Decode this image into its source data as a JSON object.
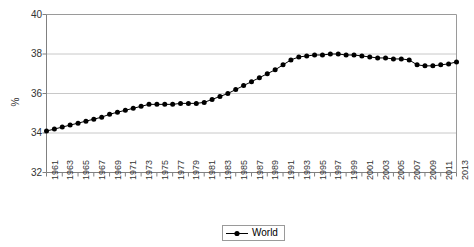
{
  "chart_data": {
    "type": "line",
    "title": "",
    "xlabel": "",
    "ylabel": "%",
    "ylim": [
      32,
      40
    ],
    "yticks": [
      32,
      34,
      36,
      38,
      40
    ],
    "xlim": [
      1961,
      2013
    ],
    "grid": true,
    "legend_position": "bottom",
    "marker": "filled-circle",
    "line_color": "#000000",
    "grid_color": "#c8c8c8",
    "axis_color": "#808080",
    "xticks": [
      1961,
      1963,
      1965,
      1967,
      1969,
      1971,
      1973,
      1975,
      1977,
      1979,
      1981,
      1983,
      1985,
      1987,
      1989,
      1991,
      1993,
      1995,
      1997,
      1999,
      2001,
      2003,
      2005,
      2007,
      2009,
      2011,
      2013
    ],
    "x": [
      1961,
      1962,
      1963,
      1964,
      1965,
      1966,
      1967,
      1968,
      1969,
      1970,
      1971,
      1972,
      1973,
      1974,
      1975,
      1976,
      1977,
      1978,
      1979,
      1980,
      1981,
      1982,
      1983,
      1984,
      1985,
      1986,
      1987,
      1988,
      1989,
      1990,
      1991,
      1992,
      1993,
      1994,
      1995,
      1996,
      1997,
      1998,
      1999,
      2000,
      2001,
      2002,
      2003,
      2004,
      2005,
      2006,
      2007,
      2008,
      2009,
      2010,
      2011,
      2012,
      2013
    ],
    "series": [
      {
        "name": "World",
        "values": [
          34.1,
          34.2,
          34.3,
          34.4,
          34.5,
          34.6,
          34.7,
          34.8,
          34.95,
          35.05,
          35.15,
          35.25,
          35.35,
          35.45,
          35.45,
          35.45,
          35.45,
          35.5,
          35.5,
          35.5,
          35.55,
          35.7,
          35.85,
          36.0,
          36.2,
          36.4,
          36.6,
          36.8,
          37.0,
          37.2,
          37.45,
          37.7,
          37.85,
          37.9,
          37.95,
          37.95,
          38.0,
          38.0,
          37.95,
          37.95,
          37.9,
          37.85,
          37.8,
          37.8,
          37.75,
          37.75,
          37.7,
          37.45,
          37.4,
          37.4,
          37.45,
          37.5,
          37.6
        ]
      }
    ]
  },
  "legend": {
    "entries": [
      {
        "label": "World"
      }
    ]
  },
  "axis": {
    "y_label": "%",
    "y_tick_labels": [
      "40",
      "38",
      "36",
      "34",
      "32"
    ]
  }
}
